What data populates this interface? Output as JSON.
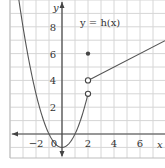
{
  "chart_data": {
    "type": "line",
    "title": "y = h(x)",
    "xlabel": "x",
    "ylabel": "y",
    "xlim": [
      -4,
      8
    ],
    "ylim": [
      -1.8,
      10
    ],
    "grid": true,
    "x_ticks": [
      -2,
      0,
      2,
      4,
      6
    ],
    "x_tick_labels": [
      "−2",
      "0",
      "2",
      "4",
      "6"
    ],
    "y_ticks": [
      2,
      4,
      6,
      8
    ],
    "y_tick_labels": [
      "2",
      "4",
      "6",
      "8"
    ],
    "series": [
      {
        "name": "parabola piece (x < 2)",
        "formula": "y = x^2 - 1",
        "x": [
          -3.3,
          -3,
          -2,
          -1,
          0,
          1,
          2
        ],
        "y": [
          9.89,
          8,
          3,
          0,
          -1,
          0,
          3
        ],
        "end_point": {
          "x": 2,
          "y": 3,
          "style": "open"
        }
      },
      {
        "name": "isolated point",
        "x": [
          2
        ],
        "y": [
          6
        ],
        "style": "filled"
      },
      {
        "name": "line piece (x > 2)",
        "formula": "y = 0.5x + 3",
        "x": [
          2,
          7.9
        ],
        "y": [
          4,
          6.95
        ],
        "start_point": {
          "x": 2,
          "y": 4,
          "style": "open"
        }
      }
    ],
    "annotations": [
      {
        "text": "y = h(x)",
        "x": 3.2,
        "y": 8
      }
    ]
  },
  "labels": {
    "function": "y = h(x)",
    "x_axis": "x",
    "y_axis": "y"
  }
}
